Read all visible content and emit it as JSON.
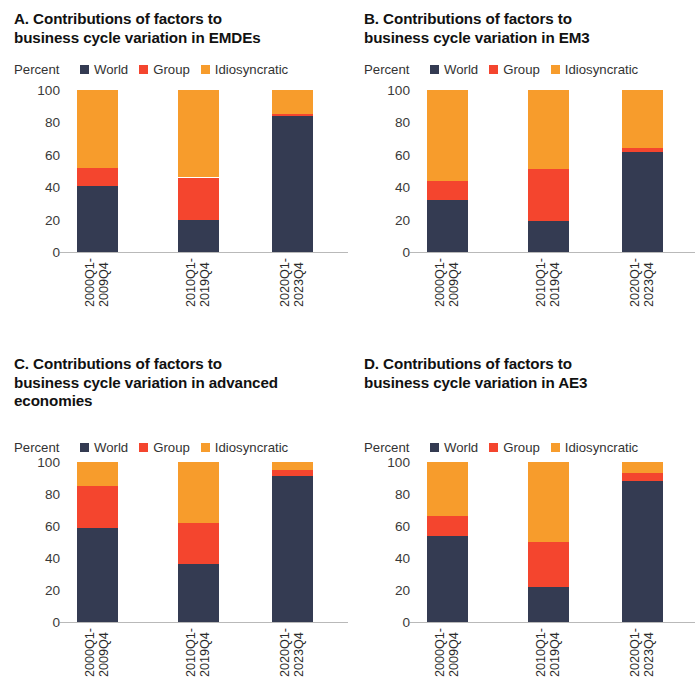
{
  "figure": {
    "unit_label": "Percent",
    "legend": [
      {
        "label": "World",
        "color": "#343b52",
        "icon": "square-swatch"
      },
      {
        "label": "Group",
        "color": "#f4452e",
        "icon": "square-swatch"
      },
      {
        "label": "Idiosyncratic",
        "color": "#f79c2c",
        "icon": "square-swatch"
      }
    ],
    "y_ticks": [
      "100",
      "80",
      "60",
      "40",
      "20",
      "0"
    ],
    "x_categories": [
      "2000Q1-\n2009Q4",
      "2010Q1-\n2019Q4",
      "2020Q1-\n2023Q4"
    ]
  },
  "panels": [
    {
      "id": "A",
      "title": "A. Contributions of factors to\nbusiness cycle variation in EMDEs"
    },
    {
      "id": "B",
      "title": "B. Contributions of factors to\nbusiness cycle variation in EM3"
    },
    {
      "id": "C",
      "title": "C. Contributions of factors to\nbusiness cycle variation in advanced\neconomies"
    },
    {
      "id": "D",
      "title": "D. Contributions of factors to\nbusiness cycle variation in AE3"
    }
  ],
  "chart_data": [
    {
      "type": "bar",
      "panel": "A",
      "stacked": true,
      "title": "A. Contributions of factors to business cycle variation in EMDEs",
      "xlabel": "",
      "ylabel": "Percent",
      "ylim": [
        0,
        100
      ],
      "yticks": [
        0,
        20,
        40,
        60,
        80,
        100
      ],
      "grid": false,
      "legend_position": "top",
      "categories": [
        "2000Q1-2009Q4",
        "2010Q1-2019Q4",
        "2020Q1-2023Q4"
      ],
      "series": [
        {
          "name": "World",
          "color": "#343b52",
          "values": [
            41,
            20,
            84
          ]
        },
        {
          "name": "Group",
          "color": "#f4452e",
          "values": [
            11,
            26,
            1
          ]
        },
        {
          "name": "Idiosyncratic",
          "color": "#f79c2c",
          "values": [
            48,
            54,
            15
          ]
        }
      ]
    },
    {
      "type": "bar",
      "panel": "B",
      "stacked": true,
      "title": "B. Contributions of factors to business cycle variation in EM3",
      "xlabel": "",
      "ylabel": "Percent",
      "ylim": [
        0,
        100
      ],
      "yticks": [
        0,
        20,
        40,
        60,
        80,
        100
      ],
      "grid": false,
      "legend_position": "top",
      "categories": [
        "2000Q1-2009Q4",
        "2010Q1-2019Q4",
        "2020Q1-2023Q4"
      ],
      "series": [
        {
          "name": "World",
          "color": "#343b52",
          "values": [
            32,
            19,
            62
          ]
        },
        {
          "name": "Group",
          "color": "#f4452e",
          "values": [
            12,
            32,
            2
          ]
        },
        {
          "name": "Idiosyncratic",
          "color": "#f79c2c",
          "values": [
            56,
            49,
            36
          ]
        }
      ]
    },
    {
      "type": "bar",
      "panel": "C",
      "stacked": true,
      "title": "C. Contributions of factors to business cycle variation in advanced economies",
      "xlabel": "",
      "ylabel": "Percent",
      "ylim": [
        0,
        100
      ],
      "yticks": [
        0,
        20,
        40,
        60,
        80,
        100
      ],
      "grid": false,
      "legend_position": "top",
      "categories": [
        "2000Q1-2009Q4",
        "2010Q1-2019Q4",
        "2020Q1-2023Q4"
      ],
      "series": [
        {
          "name": "World",
          "color": "#343b52",
          "values": [
            59,
            36,
            91
          ]
        },
        {
          "name": "Group",
          "color": "#f4452e",
          "values": [
            26,
            26,
            4
          ]
        },
        {
          "name": "Idiosyncratic",
          "color": "#f79c2c",
          "values": [
            15,
            38,
            5
          ]
        }
      ]
    },
    {
      "type": "bar",
      "panel": "D",
      "stacked": true,
      "title": "D. Contributions of factors to business cycle variation in AE3",
      "xlabel": "",
      "ylabel": "Percent",
      "ylim": [
        0,
        100
      ],
      "yticks": [
        0,
        20,
        40,
        60,
        80,
        100
      ],
      "grid": false,
      "legend_position": "top",
      "categories": [
        "2000Q1-2009Q4",
        "2010Q1-2019Q4",
        "2020Q1-2023Q4"
      ],
      "series": [
        {
          "name": "World",
          "color": "#343b52",
          "values": [
            54,
            22,
            88
          ]
        },
        {
          "name": "Group",
          "color": "#f4452e",
          "values": [
            12,
            28,
            5
          ]
        },
        {
          "name": "Idiosyncratic",
          "color": "#f79c2c",
          "values": [
            34,
            50,
            7
          ]
        }
      ]
    }
  ]
}
